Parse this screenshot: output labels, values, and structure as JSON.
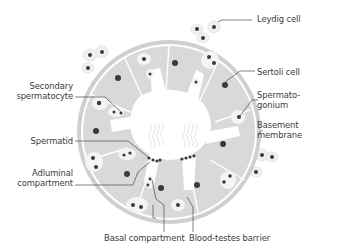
{
  "diagram": {
    "type": "seminiferous-tubule-cross-section",
    "colors": {
      "background": "#ffffff",
      "basement_membrane": "#cfcfcf",
      "tissue": "#d9d9d9",
      "lumen": "#ffffff",
      "cell_halo": "#f2f2f2",
      "nucleus": "#3a3a3a",
      "leader_line": "#4a4a4a",
      "label_text": "#3a3a3a"
    },
    "labels": {
      "leydig_cell": "Leydig cell",
      "sertoli_cell": "Sertoli cell",
      "spermatogonium_line1": "Spermato-",
      "spermatogonium_line2": "gonium",
      "basement_membrane_line1": "Basement",
      "basement_membrane_line2": "membrane",
      "secondary_spermatocyte_line1": "Secondary",
      "secondary_spermatocyte_line2": "spermatocyte",
      "spermatid": "Spermatid",
      "adluminal_compartment_line1": "Adluminal",
      "adluminal_compartment_line2": "compartment",
      "basal_compartment": "Basal compartment",
      "blood_testes_barrier": "Blood-testes barrier"
    }
  }
}
